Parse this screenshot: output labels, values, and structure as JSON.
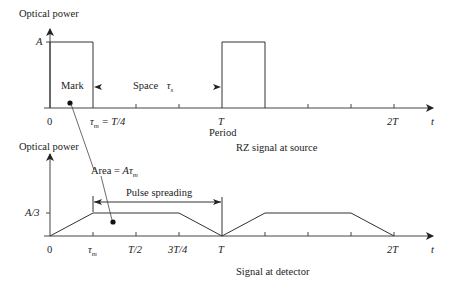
{
  "top_graph": {
    "y_axis_label": "Optical power",
    "level_label": "A",
    "mark_label": "Mark",
    "space_label": "Space",
    "space_symbol": "τs",
    "tick_labels": {
      "zero": "0",
      "tau_m": "τm = T/4",
      "T": "T",
      "two_T": "2T",
      "t_axis": "t"
    },
    "period_label": "Period",
    "caption": "RZ signal at source"
  },
  "bottom_graph": {
    "y_axis_label": "Optical power",
    "level_label": "A/3",
    "area_label": "Area = Aτm",
    "pulse_spreading_label": "Pulse spreading",
    "tick_labels": {
      "zero": "0",
      "tau_m": "τm",
      "half_T": "T/2",
      "three_quarter_T": "3T/4",
      "T": "T",
      "two_T": "2T",
      "t_axis": "t"
    },
    "caption": "Signal at detector"
  },
  "colors": {
    "line": "#333333",
    "text": "#222222",
    "background": "#ffffff"
  }
}
